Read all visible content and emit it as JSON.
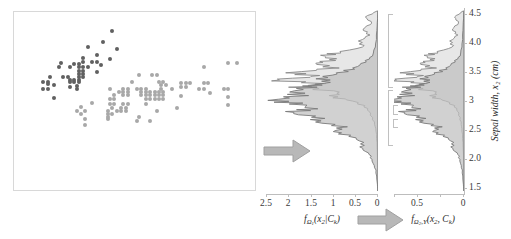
{
  "figure": {
    "title": "",
    "panels": [
      "scatter",
      "middle-density",
      "right-density"
    ]
  },
  "scatter": {
    "name": "iris-scatter",
    "class_colors": {
      "c1": "#606060",
      "c2": "#a8a8a8"
    }
  },
  "middle": {
    "xlabel": "fΩ₁(x₂|Cₖ)",
    "ticks": [
      "2.5",
      "2",
      "1.5",
      "1",
      "0.5",
      "0"
    ]
  },
  "right": {
    "xlabel": "fΩ₂,Υ(x₂, Cₖ)",
    "ticks": [
      "0.5",
      "0"
    ]
  },
  "yaxis": {
    "label": "Sepal width, x₂ (cm)",
    "ticks": [
      "4.5",
      "4.0",
      "3.5",
      "3",
      "2.5",
      "2.0",
      "1.5"
    ]
  },
  "arrows": {
    "arrow1_name": "arrow-right-primary",
    "arrow2_name": "arrow-right-secondary",
    "color": "#b5b5b5"
  },
  "chart_data": {
    "type": "scatter",
    "title": "",
    "xlabel": "",
    "ylabel": "Sepal width, x2 (cm)",
    "ylim": [
      1.5,
      4.6
    ],
    "xlim": [
      0,
      1
    ],
    "grid": false,
    "legend": "none",
    "series": [
      {
        "name": "C1",
        "color": "#606060",
        "points": [
          [
            0.4,
            4.4
          ],
          [
            0.36,
            4.2
          ],
          [
            0.29,
            4.1
          ],
          [
            0.42,
            4.05
          ],
          [
            0.33,
            3.95
          ],
          [
            0.27,
            3.88
          ],
          [
            0.39,
            3.86
          ],
          [
            0.27,
            3.8
          ],
          [
            0.31,
            3.8
          ],
          [
            0.33,
            3.8
          ],
          [
            0.17,
            3.78
          ],
          [
            0.23,
            3.76
          ],
          [
            0.25,
            3.76
          ],
          [
            0.35,
            3.74
          ],
          [
            0.16,
            3.7
          ],
          [
            0.21,
            3.7
          ],
          [
            0.25,
            3.7
          ],
          [
            0.27,
            3.7
          ],
          [
            0.29,
            3.7
          ],
          [
            0.25,
            3.64
          ],
          [
            0.27,
            3.64
          ],
          [
            0.33,
            3.62
          ],
          [
            0.25,
            3.58
          ],
          [
            0.27,
            3.58
          ],
          [
            0.12,
            3.52
          ],
          [
            0.18,
            3.52
          ],
          [
            0.2,
            3.52
          ],
          [
            0.25,
            3.52
          ],
          [
            0.27,
            3.52
          ],
          [
            0.21,
            3.46
          ],
          [
            0.23,
            3.46
          ],
          [
            0.25,
            3.46
          ],
          [
            0.09,
            3.42
          ],
          [
            0.11,
            3.42
          ],
          [
            0.21,
            3.42
          ],
          [
            0.23,
            3.42
          ],
          [
            0.25,
            3.42
          ],
          [
            0.11,
            3.38
          ],
          [
            0.14,
            3.36
          ],
          [
            0.24,
            3.34
          ],
          [
            0.21,
            3.32
          ],
          [
            0.09,
            3.28
          ],
          [
            0.11,
            3.28
          ],
          [
            0.24,
            3.28
          ],
          [
            0.14,
            3.1
          ]
        ]
      },
      {
        "name": "C2",
        "color": "#a8a8a8",
        "points": [
          [
            0.92,
            3.78
          ],
          [
            0.96,
            3.78
          ],
          [
            0.81,
            3.7
          ],
          [
            0.52,
            3.56
          ],
          [
            0.58,
            3.56
          ],
          [
            0.6,
            3.56
          ],
          [
            0.49,
            3.42
          ],
          [
            0.61,
            3.42
          ],
          [
            0.63,
            3.42
          ],
          [
            0.71,
            3.4
          ],
          [
            0.73,
            3.4
          ],
          [
            0.75,
            3.4
          ],
          [
            0.81,
            3.4
          ],
          [
            0.83,
            3.4
          ],
          [
            0.62,
            3.36
          ],
          [
            0.64,
            3.36
          ],
          [
            0.71,
            3.32
          ],
          [
            0.73,
            3.32
          ],
          [
            0.39,
            3.28
          ],
          [
            0.45,
            3.28
          ],
          [
            0.47,
            3.28
          ],
          [
            0.51,
            3.28
          ],
          [
            0.53,
            3.28
          ],
          [
            0.55,
            3.28
          ],
          [
            0.62,
            3.28
          ],
          [
            0.67,
            3.28
          ],
          [
            0.79,
            3.28
          ],
          [
            0.81,
            3.28
          ],
          [
            0.9,
            3.28
          ],
          [
            0.92,
            3.28
          ],
          [
            0.43,
            3.22
          ],
          [
            0.45,
            3.22
          ],
          [
            0.47,
            3.22
          ],
          [
            0.53,
            3.22
          ],
          [
            0.55,
            3.22
          ],
          [
            0.57,
            3.22
          ],
          [
            0.59,
            3.22
          ],
          [
            0.61,
            3.22
          ],
          [
            0.63,
            3.22
          ],
          [
            0.84,
            3.2
          ],
          [
            0.41,
            3.16
          ],
          [
            0.45,
            3.16
          ],
          [
            0.47,
            3.16
          ],
          [
            0.53,
            3.16
          ],
          [
            0.55,
            3.16
          ],
          [
            0.57,
            3.16
          ],
          [
            0.59,
            3.16
          ],
          [
            0.61,
            3.16
          ],
          [
            0.63,
            3.16
          ],
          [
            0.71,
            3.14
          ],
          [
            0.92,
            3.12
          ],
          [
            0.39,
            3.08
          ],
          [
            0.41,
            3.08
          ],
          [
            0.55,
            3.08
          ],
          [
            0.57,
            3.08
          ],
          [
            0.59,
            3.08
          ],
          [
            0.61,
            3.08
          ],
          [
            0.63,
            3.08
          ],
          [
            0.31,
            3.02
          ],
          [
            0.39,
            3.0
          ],
          [
            0.41,
            3.0
          ],
          [
            0.45,
            3.0
          ],
          [
            0.47,
            3.0
          ],
          [
            0.55,
            3.0
          ],
          [
            0.92,
            2.98
          ],
          [
            0.26,
            2.94
          ],
          [
            0.4,
            2.92
          ],
          [
            0.44,
            2.92
          ],
          [
            0.46,
            2.92
          ],
          [
            0.69,
            2.92
          ],
          [
            0.24,
            2.86
          ],
          [
            0.28,
            2.86
          ],
          [
            0.38,
            2.86
          ],
          [
            0.42,
            2.86
          ],
          [
            0.44,
            2.86
          ],
          [
            0.46,
            2.86
          ],
          [
            0.6,
            2.86
          ],
          [
            0.26,
            2.8
          ],
          [
            0.38,
            2.8
          ],
          [
            0.4,
            2.8
          ],
          [
            0.38,
            2.74
          ],
          [
            0.52,
            2.74
          ],
          [
            0.28,
            2.7
          ],
          [
            0.38,
            2.7
          ],
          [
            0.51,
            2.66
          ],
          [
            0.57,
            2.66
          ],
          [
            0.28,
            2.58
          ]
        ]
      }
    ]
  },
  "density_middle": {
    "type": "area",
    "orientation": "horizontal-left",
    "xlabel": "fΩ₁(x₂|Cₖ)",
    "xlim": [
      2.5,
      0
    ],
    "ylim": [
      1.5,
      4.6
    ],
    "series": [
      {
        "name": "C1-conditional",
        "fill": "#d9d9d9",
        "stroke": "#8a8a8a",
        "values": [
          [
            4.55,
            0.02
          ],
          [
            4.45,
            0.28
          ],
          [
            4.35,
            0.12
          ],
          [
            4.25,
            0.35
          ],
          [
            4.15,
            0.22
          ],
          [
            4.05,
            0.4
          ],
          [
            3.95,
            0.3
          ],
          [
            3.85,
            0.95
          ],
          [
            3.8,
            1.35
          ],
          [
            3.74,
            0.95
          ],
          [
            3.68,
            1.3
          ],
          [
            3.6,
            1.0
          ],
          [
            3.52,
            2.1
          ],
          [
            3.46,
            1.35
          ],
          [
            3.4,
            2.25
          ],
          [
            3.34,
            1.25
          ],
          [
            3.28,
            1.9
          ],
          [
            3.2,
            0.85
          ],
          [
            3.12,
            0.95
          ],
          [
            3.05,
            0.55
          ],
          [
            2.95,
            0.3
          ],
          [
            2.85,
            0.18
          ],
          [
            2.7,
            0.08
          ],
          [
            2.55,
            0.04
          ],
          [
            2.3,
            0.02
          ],
          [
            1.9,
            0.01
          ],
          [
            1.55,
            0.0
          ]
        ]
      },
      {
        "name": "C2-conditional",
        "fill": "#bfbfbf",
        "stroke": "#7a7a7a",
        "values": [
          [
            4.55,
            0.0
          ],
          [
            4.3,
            0.02
          ],
          [
            4.0,
            0.05
          ],
          [
            3.8,
            0.12
          ],
          [
            3.7,
            0.28
          ],
          [
            3.6,
            0.55
          ],
          [
            3.52,
            0.9
          ],
          [
            3.44,
            1.2
          ],
          [
            3.36,
            1.05
          ],
          [
            3.3,
            1.55
          ],
          [
            3.22,
            2.0
          ],
          [
            3.14,
            1.7
          ],
          [
            3.06,
            2.2
          ],
          [
            3.0,
            1.85
          ],
          [
            2.92,
            1.6
          ],
          [
            2.86,
            1.95
          ],
          [
            2.78,
            1.25
          ],
          [
            2.7,
            1.4
          ],
          [
            2.62,
            0.85
          ],
          [
            2.54,
            0.95
          ],
          [
            2.46,
            0.55
          ],
          [
            2.36,
            0.35
          ],
          [
            2.26,
            0.4
          ],
          [
            2.16,
            0.18
          ],
          [
            2.05,
            0.12
          ],
          [
            1.9,
            0.05
          ],
          [
            1.7,
            0.02
          ],
          [
            1.55,
            0.0
          ]
        ]
      }
    ]
  },
  "density_right": {
    "type": "area",
    "orientation": "horizontal-left",
    "xlabel": "fΩ₂,Υ(x₂, Cₖ)",
    "xlim": [
      0.75,
      0
    ],
    "ylim": [
      1.5,
      4.6
    ],
    "series": [
      {
        "name": "C1-joint",
        "fill": "#d9d9d9",
        "stroke": "#8a8a8a",
        "values": [
          [
            4.55,
            0.01
          ],
          [
            4.45,
            0.1
          ],
          [
            4.35,
            0.05
          ],
          [
            4.25,
            0.13
          ],
          [
            4.15,
            0.08
          ],
          [
            4.05,
            0.14
          ],
          [
            3.95,
            0.11
          ],
          [
            3.85,
            0.32
          ],
          [
            3.8,
            0.45
          ],
          [
            3.74,
            0.32
          ],
          [
            3.68,
            0.44
          ],
          [
            3.6,
            0.34
          ],
          [
            3.52,
            0.7
          ],
          [
            3.46,
            0.45
          ],
          [
            3.4,
            0.74
          ],
          [
            3.34,
            0.42
          ],
          [
            3.28,
            0.63
          ],
          [
            3.2,
            0.29
          ],
          [
            3.12,
            0.32
          ],
          [
            3.05,
            0.19
          ],
          [
            2.95,
            0.1
          ],
          [
            2.85,
            0.06
          ],
          [
            2.7,
            0.03
          ],
          [
            2.55,
            0.02
          ],
          [
            2.3,
            0.01
          ],
          [
            1.9,
            0.0
          ],
          [
            1.55,
            0.0
          ]
        ]
      },
      {
        "name": "C2-joint",
        "fill": "#bfbfbf",
        "stroke": "#7a7a7a",
        "values": [
          [
            4.55,
            0.0
          ],
          [
            4.3,
            0.01
          ],
          [
            4.0,
            0.02
          ],
          [
            3.8,
            0.04
          ],
          [
            3.7,
            0.1
          ],
          [
            3.6,
            0.19
          ],
          [
            3.52,
            0.31
          ],
          [
            3.44,
            0.41
          ],
          [
            3.36,
            0.36
          ],
          [
            3.3,
            0.53
          ],
          [
            3.22,
            0.68
          ],
          [
            3.14,
            0.58
          ],
          [
            3.06,
            0.74
          ],
          [
            3.0,
            0.63
          ],
          [
            2.92,
            0.55
          ],
          [
            2.86,
            0.66
          ],
          [
            2.78,
            0.43
          ],
          [
            2.7,
            0.48
          ],
          [
            2.62,
            0.29
          ],
          [
            2.54,
            0.32
          ],
          [
            2.46,
            0.19
          ],
          [
            2.36,
            0.12
          ],
          [
            2.26,
            0.14
          ],
          [
            2.16,
            0.06
          ],
          [
            2.05,
            0.04
          ],
          [
            1.9,
            0.02
          ],
          [
            1.7,
            0.01
          ],
          [
            1.55,
            0.0
          ]
        ]
      }
    ]
  }
}
